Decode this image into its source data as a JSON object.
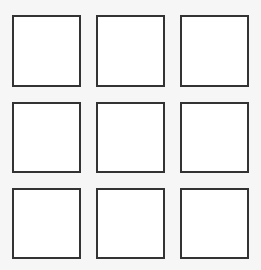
{
  "grid": {
    "rows": 3,
    "columns": 3,
    "cells": [
      {
        "row": 1,
        "col": 1,
        "label": ""
      },
      {
        "row": 1,
        "col": 2,
        "label": ""
      },
      {
        "row": 1,
        "col": 3,
        "label": ""
      },
      {
        "row": 2,
        "col": 1,
        "label": ""
      },
      {
        "row": 2,
        "col": 2,
        "label": ""
      },
      {
        "row": 2,
        "col": 3,
        "label": ""
      },
      {
        "row": 3,
        "col": 1,
        "label": ""
      },
      {
        "row": 3,
        "col": 2,
        "label": ""
      },
      {
        "row": 3,
        "col": 3,
        "label": ""
      }
    ]
  },
  "colors": {
    "background": "#f6f6f6",
    "cell_fill": "#ffffff",
    "cell_border": "#333333"
  }
}
